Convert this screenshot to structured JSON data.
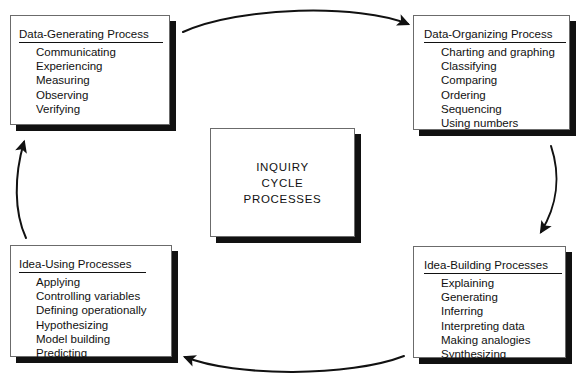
{
  "diagram": {
    "center": {
      "lines": [
        "INQUIRY",
        "CYCLE",
        "PROCESSES"
      ]
    },
    "nodes": [
      {
        "id": "data-generating-process",
        "title": "Data-Generating Process",
        "items": [
          "Communicating",
          "Experiencing",
          "Measuring",
          "Observing",
          "Verifying"
        ]
      },
      {
        "id": "data-organizing-process",
        "title": "Data-Organizing Process",
        "items": [
          "Charting and graphing",
          "Classifying",
          "Comparing",
          "Ordering",
          "Sequencing",
          "Using numbers"
        ]
      },
      {
        "id": "idea-building-processes",
        "title": "Idea-Building Processes",
        "items": [
          "Explaining",
          "Generating",
          "Inferring",
          "Interpreting data",
          "Making analogies",
          "Synthesizing"
        ]
      },
      {
        "id": "idea-using-processes",
        "title": "Idea-Using Processes",
        "items": [
          "Applying",
          "Controlling variables",
          "Defining operationally",
          "Hypothesizing",
          "Model building",
          "Predicting"
        ]
      }
    ],
    "arrows": [
      {
        "id": "arrow-top",
        "from": "data-generating-process",
        "to": "data-organizing-process",
        "direction": "right"
      },
      {
        "id": "arrow-right",
        "from": "data-organizing-process",
        "to": "idea-building-processes",
        "direction": "down"
      },
      {
        "id": "arrow-bottom",
        "from": "idea-building-processes",
        "to": "idea-using-processes",
        "direction": "left"
      },
      {
        "id": "arrow-left",
        "from": "idea-using-processes",
        "to": "data-generating-process",
        "direction": "up"
      }
    ],
    "colors": {
      "ink": "#111111",
      "panel": "#ffffff",
      "panel_border": "#6b6b6b",
      "shadow": "#111111",
      "background": "#ffffff"
    }
  }
}
